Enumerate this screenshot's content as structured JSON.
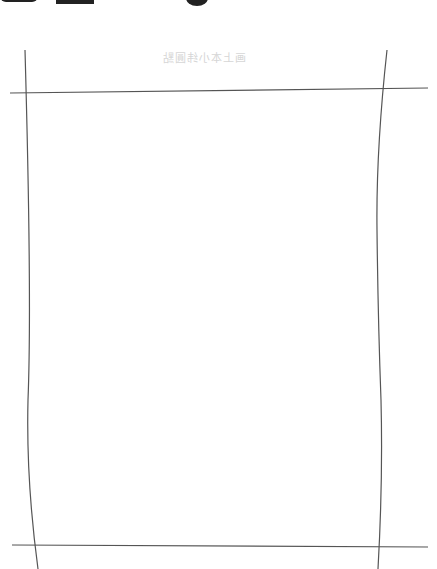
{
  "page": {
    "background": "#ffffff",
    "line_color": "#555555"
  },
  "header": {
    "ghost_text": "画上本小纬圓點"
  },
  "crop_lines": {
    "top_horizontal": {
      "x1": 10,
      "y1": 93,
      "x2": 428,
      "y2": 88
    },
    "bottom_horizontal": {
      "x1": 12,
      "y1": 545,
      "x2": 428,
      "y2": 547
    },
    "left_vertical": "M25 50 Q32 300 28 400 Q26 480 38 569",
    "right_vertical": "M387 50 Q376 150 377 230 Q378 320 381 400 Q383 480 378 569"
  }
}
